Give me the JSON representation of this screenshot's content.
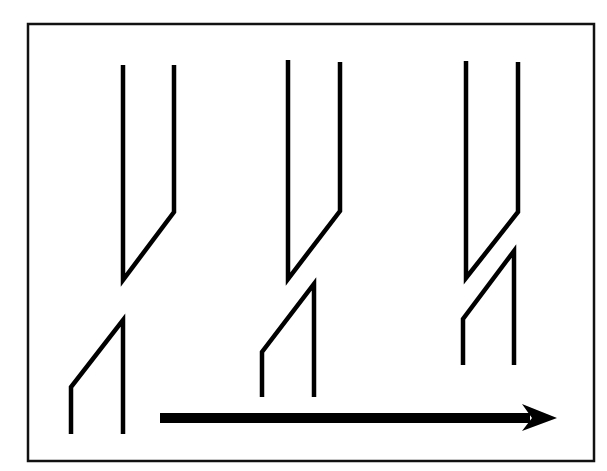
{
  "diagram": {
    "width": 607,
    "height": 471,
    "colors": {
      "background": "#ffffff",
      "stroke": "#000000",
      "frame": "#111111"
    },
    "frame": {
      "x": 28,
      "y": 24,
      "width": 566,
      "height": 437
    },
    "stages": [
      {
        "label": "stage-1",
        "upper": [
          [
            123,
            65
          ],
          [
            123,
            280
          ],
          [
            174,
            212
          ],
          [
            174,
            65
          ]
        ],
        "lower": [
          [
            71,
            434
          ],
          [
            71,
            387
          ],
          [
            123,
            320
          ],
          [
            123,
            434
          ]
        ]
      },
      {
        "label": "stage-2",
        "upper": [
          [
            288,
            60
          ],
          [
            288,
            279
          ],
          [
            340,
            211
          ],
          [
            340,
            62
          ]
        ],
        "lower": [
          [
            262,
            397
          ],
          [
            262,
            352
          ],
          [
            314,
            284
          ],
          [
            314,
            397
          ]
        ]
      },
      {
        "label": "stage-3",
        "upper": [
          [
            466,
            61
          ],
          [
            466,
            278
          ],
          [
            518,
            212
          ],
          [
            518,
            62
          ]
        ],
        "lower": [
          [
            463,
            365
          ],
          [
            463,
            319
          ],
          [
            514,
            251
          ],
          [
            514,
            365
          ]
        ]
      }
    ],
    "arrow": {
      "direction": "right",
      "shaft": {
        "x1": 160,
        "y1": 418,
        "x2": 530,
        "y2": 418
      },
      "head": [
        [
          557,
          418
        ],
        [
          522,
          404
        ],
        [
          532,
          418
        ],
        [
          522,
          431
        ]
      ]
    }
  }
}
